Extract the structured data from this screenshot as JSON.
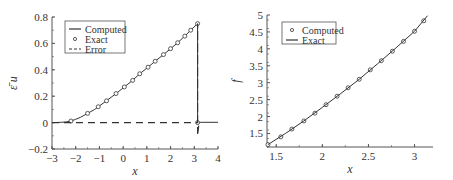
{
  "chart_data": [
    {
      "type": "line",
      "title": "",
      "xlabel": "x",
      "ylabel": "ε̄ u",
      "xlim": [
        -3,
        4
      ],
      "ylim": [
        -0.2,
        0.8
      ],
      "xticks": [
        -3,
        -2,
        -1,
        0,
        1,
        2,
        3,
        4
      ],
      "yticks": [
        -0.2,
        0,
        0.2,
        0.4,
        0.6,
        0.8
      ],
      "xtick_labels": [
        "−3",
        "−2",
        "−1",
        "0",
        "1",
        "2",
        "3",
        "4"
      ],
      "ytick_labels": [
        "−0.2",
        "0",
        "0.2",
        "0.4",
        "0.6",
        "0.8"
      ],
      "grid": false,
      "legend_position": "upper left",
      "legend": [
        "Computed",
        "Exact",
        "Error"
      ],
      "series": [
        {
          "name": "Computed",
          "style": "solid",
          "x": [
            -3,
            -2.6,
            -2.4,
            -2.2,
            -2.0,
            -1.8,
            -1.5,
            -1.2,
            -1.05,
            -0.7,
            -0.3,
            0.05,
            0.4,
            0.7,
            1.05,
            1.35,
            1.7,
            2.0,
            2.3,
            2.6,
            2.85,
            3.14,
            3.14,
            3.3,
            4.0
          ],
          "y": [
            0,
            0.002,
            0.005,
            0.012,
            0.025,
            0.04,
            0.07,
            0.1,
            0.12,
            0.165,
            0.22,
            0.27,
            0.32,
            0.37,
            0.42,
            0.465,
            0.515,
            0.56,
            0.605,
            0.655,
            0.7,
            0.75,
            0,
            0.002,
            0.002
          ]
        },
        {
          "name": "Exact",
          "style": "circles",
          "x": [
            -2.2,
            -1.5,
            -1.05,
            -0.7,
            -0.3,
            0.05,
            0.4,
            0.7,
            1.05,
            1.35,
            1.7,
            2.0,
            2.3,
            2.6,
            2.85,
            3.14,
            3.14
          ],
          "y": [
            0.012,
            0.07,
            0.12,
            0.165,
            0.22,
            0.27,
            0.32,
            0.37,
            0.42,
            0.465,
            0.515,
            0.56,
            0.605,
            0.655,
            0.7,
            0.75,
            0.0
          ]
        },
        {
          "name": "Error",
          "style": "dashed",
          "x": [
            -3,
            -2.2,
            0,
            2,
            3.1,
            3.14,
            3.14,
            3.14,
            3.2
          ],
          "y": [
            0,
            0,
            0,
            0,
            0,
            0,
            0.75,
            -0.1,
            0
          ]
        }
      ]
    },
    {
      "type": "line",
      "title": "",
      "xlabel": "x",
      "ylabel": "f",
      "xlim": [
        1.4,
        3.2
      ],
      "ylim": [
        1.1,
        5
      ],
      "xticks": [
        1.5,
        2,
        2.5,
        3
      ],
      "yticks": [
        1.5,
        2,
        2.5,
        3,
        3.5,
        4,
        4.5,
        5
      ],
      "xtick_labels": [
        "1.5",
        "2",
        "2.5",
        "3"
      ],
      "ytick_labels": [
        "1.5",
        "2",
        "2.5",
        "3",
        "3.5",
        "4",
        "4.5",
        "5"
      ],
      "grid": false,
      "legend_position": "upper left",
      "legend": [
        "Computed",
        "Exact"
      ],
      "series": [
        {
          "name": "Computed",
          "style": "circles",
          "x": [
            1.41,
            1.55,
            1.67,
            1.8,
            1.92,
            2.04,
            2.16,
            2.28,
            2.4,
            2.52,
            2.64,
            2.76,
            2.88,
            3.0,
            3.1
          ],
          "y": [
            1.17,
            1.4,
            1.63,
            1.87,
            2.1,
            2.35,
            2.6,
            2.85,
            3.1,
            3.38,
            3.65,
            3.93,
            4.22,
            4.52,
            4.83
          ]
        },
        {
          "name": "Exact",
          "style": "solid",
          "x": [
            1.41,
            1.6,
            1.8,
            2.0,
            2.2,
            2.4,
            2.6,
            2.8,
            3.0,
            3.14
          ],
          "y": [
            1.17,
            1.5,
            1.87,
            2.27,
            2.68,
            3.1,
            3.56,
            4.03,
            4.52,
            4.98
          ]
        }
      ]
    }
  ],
  "left": {
    "ylabel": "ε̄ u",
    "xlabel": "x",
    "legend": {
      "computed": "Computed",
      "exact": "Exact",
      "error": "Error"
    }
  },
  "right": {
    "ylabel": "f",
    "xlabel": "x",
    "legend": {
      "computed": "Computed",
      "exact": "Exact"
    }
  },
  "colors": {
    "line": "#333333",
    "axis": "#555555"
  }
}
